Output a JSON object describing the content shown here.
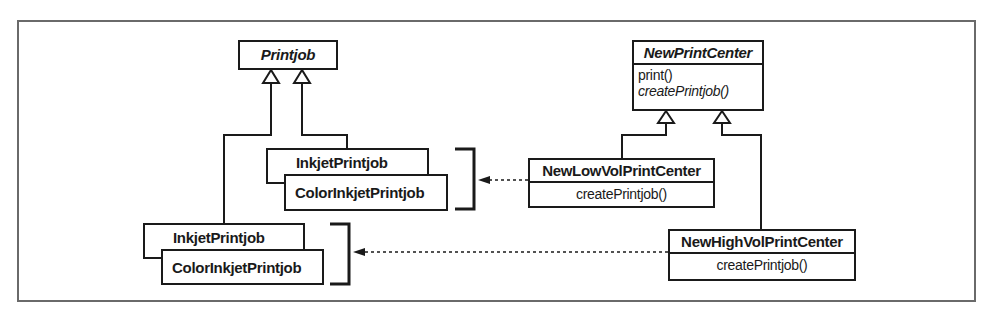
{
  "diagram": {
    "type": "UML class diagram",
    "classes": {
      "printjob": {
        "name": "Printjob",
        "abstract": true
      },
      "print_center": {
        "name": "NewPrintCenter",
        "abstract": true,
        "operations": [
          "print()",
          "createPrintjob()"
        ]
      },
      "low_vol": {
        "name": "NewLowVolPrintCenter",
        "operations": [
          "createPrintjob()"
        ]
      },
      "high_vol": {
        "name": "NewHighVolPrintCenter",
        "operations": [
          "createPrintjob()"
        ]
      },
      "upper_group": {
        "items": [
          "InkjetPrintjob",
          "ColorInkjetPrintjob"
        ]
      },
      "lower_group": {
        "items": [
          "InkjetPrintjob",
          "ColorInkjetPrintjob"
        ]
      }
    },
    "relationships": [
      {
        "type": "generalization",
        "from": "upper_group",
        "to": "Printjob"
      },
      {
        "type": "generalization",
        "from": "lower_group",
        "to": "Printjob"
      },
      {
        "type": "generalization",
        "from": "NewLowVolPrintCenter",
        "to": "NewPrintCenter"
      },
      {
        "type": "generalization",
        "from": "NewHighVolPrintCenter",
        "to": "NewPrintCenter"
      },
      {
        "type": "dependency",
        "from": "NewLowVolPrintCenter",
        "to": "upper_group"
      },
      {
        "type": "dependency",
        "from": "NewHighVolPrintCenter",
        "to": "lower_group"
      }
    ],
    "colors": {
      "line": "#1a1a1a",
      "frame": "#6a6a6a",
      "background": "#ffffff"
    }
  }
}
